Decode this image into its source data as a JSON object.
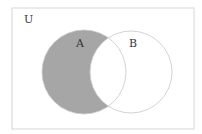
{
  "diagram": {
    "type": "venn",
    "universe_label": "U",
    "sets": [
      {
        "label": "A",
        "shaded": true
      },
      {
        "label": "B",
        "shaded": false
      }
    ],
    "shaded_region": "A minus B",
    "colors": {
      "shade": "#a6a6a6",
      "border": "#c8c8c8",
      "outline": "#d6d6d6",
      "text": "#333333"
    }
  }
}
